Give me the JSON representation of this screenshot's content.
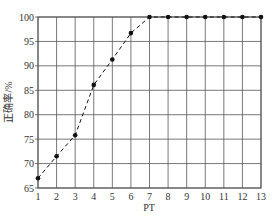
{
  "chart_data": {
    "type": "line",
    "title": "",
    "xlabel": "PT",
    "ylabel": "正确率/%",
    "x": [
      1,
      2,
      3,
      4,
      5,
      6,
      7,
      8,
      9,
      10,
      11,
      12,
      13
    ],
    "series": [
      {
        "name": "正确率",
        "values": [
          67.0,
          71.5,
          75.8,
          86.1,
          91.3,
          96.7,
          100,
          100,
          100,
          100,
          100,
          100,
          100
        ],
        "line_style": "dashed",
        "marker": "circle",
        "color": "#111111"
      }
    ],
    "xlim": [
      1,
      13
    ],
    "ylim": [
      65,
      100
    ],
    "xticks": [
      "1",
      "2",
      "3",
      "4",
      "5",
      "6",
      "7",
      "8",
      "9",
      "10",
      "11",
      "12",
      "13"
    ],
    "yticks": [
      "65",
      "70",
      "75",
      "80",
      "85",
      "90",
      "95",
      "100"
    ],
    "grid": true,
    "legend": null
  },
  "colors": {
    "grid": "#555555",
    "line": "#111111",
    "text": "#333333"
  }
}
